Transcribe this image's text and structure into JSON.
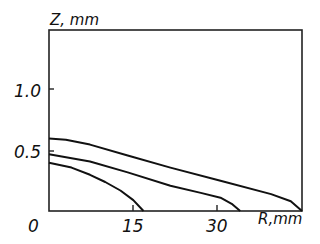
{
  "chart_data": {
    "type": "line",
    "title": "",
    "xlabel": "R, mm",
    "ylabel": "Z, mm",
    "xlim": [
      0,
      45
    ],
    "ylim": [
      0,
      1.5
    ],
    "x_ticks": [
      "15",
      "30"
    ],
    "y_ticks": [
      "0.5",
      "1.0"
    ],
    "origin_label": "0",
    "grid": false,
    "legend": null,
    "series": [
      {
        "name": "curve-1",
        "points": [
          [
            0,
            0.6
          ],
          [
            3,
            0.59
          ],
          [
            7.3,
            0.55
          ],
          [
            14,
            0.46
          ],
          [
            21.6,
            0.36
          ],
          [
            30.5,
            0.25
          ],
          [
            39.5,
            0.14
          ],
          [
            43,
            0.08
          ],
          [
            45,
            0.0
          ]
        ]
      },
      {
        "name": "curve-2",
        "points": [
          [
            0,
            0.47
          ],
          [
            7.3,
            0.41
          ],
          [
            14,
            0.32
          ],
          [
            21.6,
            0.21
          ],
          [
            27,
            0.15
          ],
          [
            30.5,
            0.11
          ],
          [
            32.5,
            0.06
          ],
          [
            34,
            0.0
          ]
        ]
      },
      {
        "name": "curve-3",
        "points": [
          [
            0,
            0.4
          ],
          [
            4,
            0.36
          ],
          [
            7.3,
            0.3
          ],
          [
            10,
            0.24
          ],
          [
            12.7,
            0.17
          ],
          [
            15,
            0.09
          ],
          [
            16.8,
            0.0
          ]
        ]
      }
    ]
  },
  "labels": {
    "ylabel": "Z, mm",
    "xlabel": "R,mm",
    "origin": "0",
    "x15": "15",
    "x30": "30",
    "y05": "0.5",
    "y10": "1.0"
  }
}
